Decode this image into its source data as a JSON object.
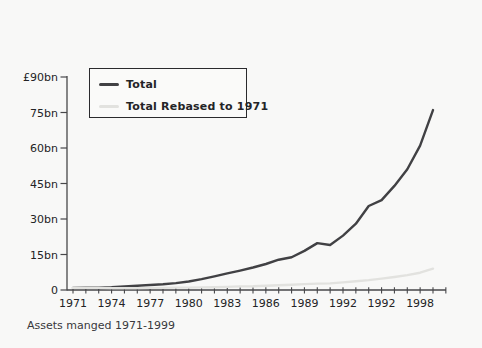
{
  "page": {
    "background": "#f8f8f7",
    "axis_color": "#47474a",
    "text_color": "#232325"
  },
  "caption": "Assets manged 1971-1999",
  "legend": {
    "items": [
      {
        "label": "Total",
        "color": "#414144"
      },
      {
        "label": "Total Rebased to 1971",
        "color": "#e2e2df"
      }
    ]
  },
  "chart_data": {
    "type": "line",
    "title": "",
    "xlabel": "",
    "ylabel": "",
    "caption": "Assets manged 1971-1999",
    "grid": false,
    "legend_position": "top-left-inside",
    "x_range": [
      1970.5,
      2000.3
    ],
    "ylim": [
      0,
      90
    ],
    "y_ticks": [
      {
        "value": 90,
        "label": "£90bn"
      },
      {
        "value": 75,
        "label": "75bn"
      },
      {
        "value": 60,
        "label": "60bn"
      },
      {
        "value": 45,
        "label": "45bn"
      },
      {
        "value": 30,
        "label": "30bn"
      },
      {
        "value": 15,
        "label": "15bn"
      },
      {
        "value": 0,
        "label": "0"
      }
    ],
    "x_minor_tick_range": [
      1971,
      2000
    ],
    "x_tick_labels": [
      {
        "year": 1971,
        "label": "1971"
      },
      {
        "year": 1974,
        "label": "1974"
      },
      {
        "year": 1977,
        "label": "1977"
      },
      {
        "year": 1980,
        "label": "1980"
      },
      {
        "year": 1983,
        "label": "1983"
      },
      {
        "year": 1986,
        "label": "1986"
      },
      {
        "year": 1989,
        "label": "1989"
      },
      {
        "year": 1992,
        "label": "1992"
      },
      {
        "year": 1995,
        "label": "1992"
      },
      {
        "year": 1998,
        "label": "1998"
      }
    ],
    "x": [
      1971,
      1972,
      1973,
      1974,
      1975,
      1976,
      1977,
      1978,
      1979,
      1980,
      1981,
      1982,
      1983,
      1984,
      1985,
      1986,
      1987,
      1988,
      1989,
      1990,
      1991,
      1992,
      1993,
      1994,
      1995,
      1996,
      1997,
      1998,
      1999
    ],
    "series": [
      {
        "name": "Total",
        "color": "#414144",
        "line_width": 2.4,
        "values": [
          0.9,
          1.0,
          1.0,
          1.2,
          1.5,
          1.8,
          2.1,
          2.4,
          2.9,
          3.6,
          4.6,
          5.8,
          7.0,
          8.2,
          9.5,
          11.0,
          12.8,
          13.8,
          16.5,
          19.8,
          19.0,
          23.0,
          28.0,
          35.5,
          38.0,
          44.0,
          51.0,
          61.0,
          76.0
        ]
      },
      {
        "name": "Total Rebased to 1971",
        "color": "#e2e2df",
        "line_width": 2.4,
        "values": [
          0.9,
          0.9,
          0.9,
          0.8,
          0.8,
          0.8,
          0.9,
          0.9,
          1.0,
          1.0,
          1.1,
          1.2,
          1.3,
          1.5,
          1.6,
          1.8,
          2.0,
          2.2,
          2.5,
          2.7,
          2.8,
          3.2,
          3.7,
          4.2,
          4.8,
          5.5,
          6.3,
          7.3,
          9.0
        ]
      }
    ]
  }
}
